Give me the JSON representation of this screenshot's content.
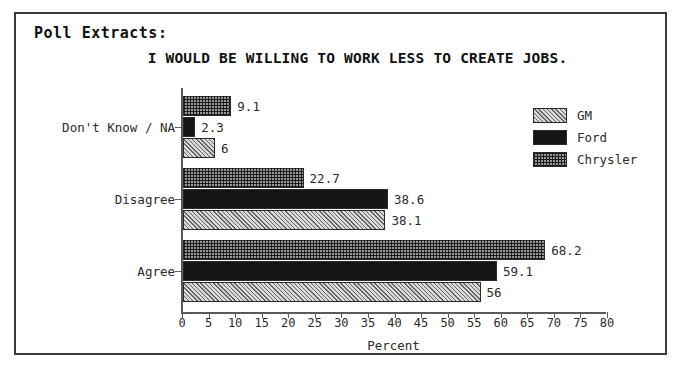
{
  "frame": {
    "heading": "Poll Extracts:"
  },
  "chart_data": {
    "type": "bar",
    "orientation": "horizontal",
    "title": "I WOULD BE WILLING TO WORK LESS TO CREATE JOBS.",
    "xlabel": "Percent",
    "ylabel": "",
    "xlim": [
      0,
      80
    ],
    "xticks": [
      0,
      5,
      10,
      15,
      20,
      25,
      30,
      35,
      40,
      45,
      50,
      55,
      60,
      65,
      70,
      75,
      80
    ],
    "xtick_labels": [
      "0",
      "5",
      "10",
      "15",
      "20",
      "25",
      "30",
      "35",
      "40",
      "45",
      "50",
      "55",
      "60",
      "65",
      "70",
      "75",
      "80"
    ],
    "grid": false,
    "legend_position": "top-right",
    "categories": [
      "Agree",
      "Disagree",
      "Don't Know / NA"
    ],
    "series": [
      {
        "name": "GM",
        "pattern": "light-diagonal-hatch",
        "color": "#d9d9d9",
        "values": [
          56,
          38.1,
          6
        ],
        "labels": [
          "56",
          "38.1",
          "6"
        ]
      },
      {
        "name": "Ford",
        "pattern": "solid-black",
        "color": "#151515",
        "values": [
          59.1,
          38.6,
          2.3
        ],
        "labels": [
          "59.1",
          "38.6",
          "2.3"
        ]
      },
      {
        "name": "Chrysler",
        "pattern": "dense-crosshatch",
        "color": "#9a9a9a",
        "values": [
          68.2,
          22.7,
          9.1
        ],
        "labels": [
          "68.2",
          "22.7",
          "9.1"
        ]
      }
    ]
  }
}
